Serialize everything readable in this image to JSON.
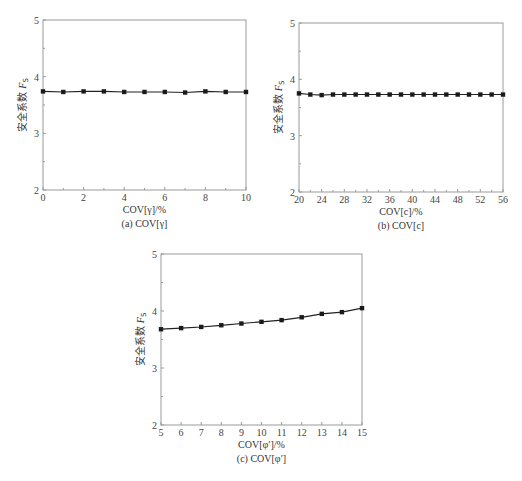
{
  "chart_data": [
    {
      "type": "line",
      "id": "a",
      "caption": "(a)  COV[γ]",
      "xlabel": "COV[γ]/%",
      "ylabel": "安全系数 Fs",
      "ylabel_main": "安全系数 ",
      "ylabel_var": "F",
      "ylabel_sub": "S",
      "xlim": [
        0,
        10
      ],
      "ylim": [
        2,
        5
      ],
      "xticks": [
        0,
        2,
        4,
        6,
        8,
        10
      ],
      "xminor": [
        1,
        3,
        5,
        7,
        9
      ],
      "yticks": [
        2,
        3,
        4,
        5
      ],
      "grid": false,
      "legend": null,
      "x": [
        0,
        1,
        2,
        3,
        4,
        5,
        6,
        7,
        8,
        9,
        10
      ],
      "values": [
        3.74,
        3.73,
        3.74,
        3.74,
        3.73,
        3.73,
        3.73,
        3.72,
        3.74,
        3.73,
        3.73
      ],
      "box": {
        "left": 43,
        "top": 20,
        "right": 246,
        "bottom": 190
      }
    },
    {
      "type": "line",
      "id": "b",
      "caption": "(b)  COV[c]",
      "xlabel": "COV[c]/%",
      "ylabel": "安全系数 Fs",
      "ylabel_main": "安全系数 ",
      "ylabel_var": "F",
      "ylabel_sub": "S",
      "xlim": [
        20,
        56
      ],
      "ylim": [
        2,
        5
      ],
      "xticks": [
        20,
        24,
        28,
        32,
        36,
        40,
        44,
        48,
        52,
        56
      ],
      "xminor": [
        22,
        26,
        30,
        34,
        38,
        42,
        46,
        50,
        54
      ],
      "yticks": [
        2,
        3,
        4,
        5
      ],
      "grid": false,
      "legend": null,
      "x": [
        20,
        22,
        24,
        26,
        28,
        30,
        32,
        34,
        36,
        38,
        40,
        42,
        44,
        46,
        48,
        50,
        52,
        54,
        56
      ],
      "values": [
        3.75,
        3.73,
        3.72,
        3.73,
        3.73,
        3.73,
        3.73,
        3.73,
        3.73,
        3.73,
        3.73,
        3.73,
        3.73,
        3.73,
        3.73,
        3.73,
        3.73,
        3.73,
        3.73
      ],
      "box": {
        "left": 299,
        "top": 23,
        "right": 503,
        "bottom": 192
      }
    },
    {
      "type": "line",
      "id": "c",
      "caption": "(c) COV[φ′]",
      "xlabel": "COV[φ′]/%",
      "ylabel": "安全系数 Fs",
      "ylabel_main": "安全系数 ",
      "ylabel_var": "F",
      "ylabel_sub": "S",
      "xlim": [
        5,
        15
      ],
      "ylim": [
        2,
        5
      ],
      "xticks": [
        5,
        6,
        7,
        8,
        9,
        10,
        11,
        12,
        13,
        14,
        15
      ],
      "xminor": [],
      "yticks": [
        2,
        3,
        4,
        5
      ],
      "grid": false,
      "legend": null,
      "x": [
        5,
        6,
        7,
        8,
        9,
        10,
        11,
        12,
        13,
        14,
        15
      ],
      "values": [
        3.68,
        3.7,
        3.72,
        3.75,
        3.78,
        3.81,
        3.84,
        3.89,
        3.95,
        3.98,
        4.05
      ],
      "box": {
        "left": 161,
        "top": 254,
        "right": 362,
        "bottom": 425
      }
    }
  ],
  "style": {
    "axis_color": "#9a9a9a",
    "line_color": "#222222",
    "marker_color": "#1a1a1a"
  }
}
